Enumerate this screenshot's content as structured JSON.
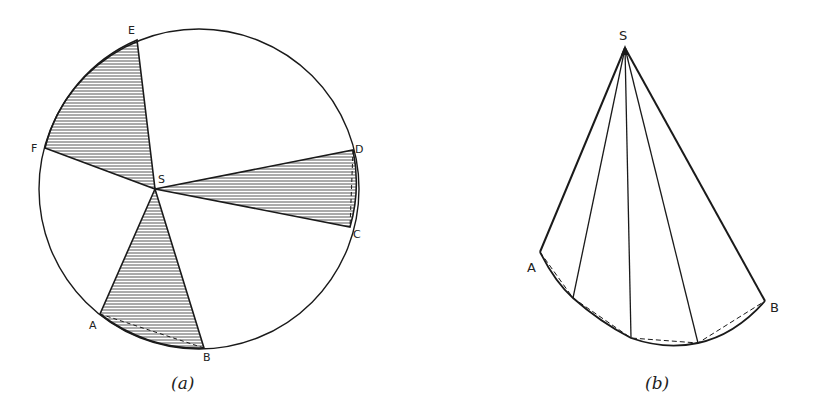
{
  "figure_a": {
    "caption": "(a)",
    "center": [
      199,
      189
    ],
    "radius": 160,
    "apex": {
      "label": "S",
      "point": [
        155,
        189
      ],
      "label_pos": [
        160,
        182
      ]
    },
    "points": [
      {
        "label": "E",
        "point": [
          137,
          40
        ],
        "label_pos": [
          132,
          33
        ]
      },
      {
        "label": "F",
        "point": [
          45,
          148
        ],
        "label_pos": [
          33,
          149
        ]
      },
      {
        "label": "A",
        "point": [
          100,
          314
        ],
        "label_pos": [
          94,
          329
        ]
      },
      {
        "label": "B",
        "point": [
          204,
          348
        ],
        "label_pos": [
          207,
          361
        ]
      },
      {
        "label": "C",
        "point": [
          350,
          227
        ],
        "label_pos": [
          357,
          237
        ]
      },
      {
        "label": "D",
        "point": [
          353,
          150
        ],
        "label_pos": [
          358,
          152
        ]
      }
    ],
    "shaded_sectors": [
      [
        "E",
        "F"
      ],
      [
        "A",
        "B"
      ],
      [
        "D",
        "C"
      ]
    ],
    "hatch_color": "#555555",
    "stroke_color": "#1a1a1a"
  },
  "figure_b": {
    "caption": "(b)",
    "apex": {
      "label": "S",
      "point": [
        625,
        48
      ],
      "label_pos": [
        624,
        38
      ]
    },
    "end_a": {
      "label": "A",
      "point": [
        540,
        252
      ],
      "label_pos": [
        533,
        270
      ]
    },
    "end_b": {
      "label": "B",
      "point": [
        765,
        301
      ],
      "label_pos": [
        777,
        312
      ]
    },
    "intermediate_points": [
      [
        573,
        298
      ],
      [
        631,
        338
      ],
      [
        698,
        343
      ]
    ],
    "chords": "dashed",
    "stroke_color": "#1a1a1a"
  }
}
